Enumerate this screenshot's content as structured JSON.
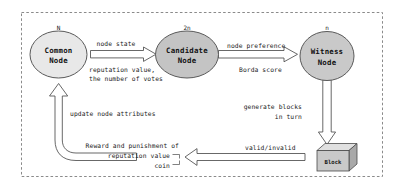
{
  "diagram": {
    "border": {
      "style": "dashed",
      "color": "#8a8a8a"
    },
    "nodes": [
      {
        "id": "common-node",
        "line1": "Common",
        "line2": "Node",
        "count_label": "N",
        "fill": "#e8e8e8",
        "stroke": "#5a5a5a"
      },
      {
        "id": "candidate-node",
        "line1": "Candidate",
        "line2": "Node",
        "count_label": "2n",
        "fill": "#c4c4c4",
        "stroke": "#5a5a5a"
      },
      {
        "id": "witness-node",
        "line1": "Witness",
        "line2": "Node",
        "count_label": "n",
        "fill": "#c9c9c9",
        "stroke": "#5a5a5a"
      }
    ],
    "block": {
      "id": "block-shape",
      "label": "Block",
      "fill": "#c9c9c9",
      "top_fill": "#e0e0e0",
      "side_fill": "#a9a9a9",
      "stroke": "#4a4a4a"
    },
    "edge_labels": {
      "node_state": "node state",
      "reputation_votes_line1": "reputation value,",
      "reputation_votes_line2": "the number of votes",
      "node_preference": "node preference",
      "borda_score": "Borda score",
      "generate_blocks_line1": "generate blocks",
      "generate_blocks_line2": "in turn",
      "valid_invalid": "valid/invalid",
      "update_node_attributes": "update node attributes",
      "reward_line1": "Reward and punishment of",
      "reward_line2": "reputation value",
      "reward_line3": "coin"
    }
  }
}
